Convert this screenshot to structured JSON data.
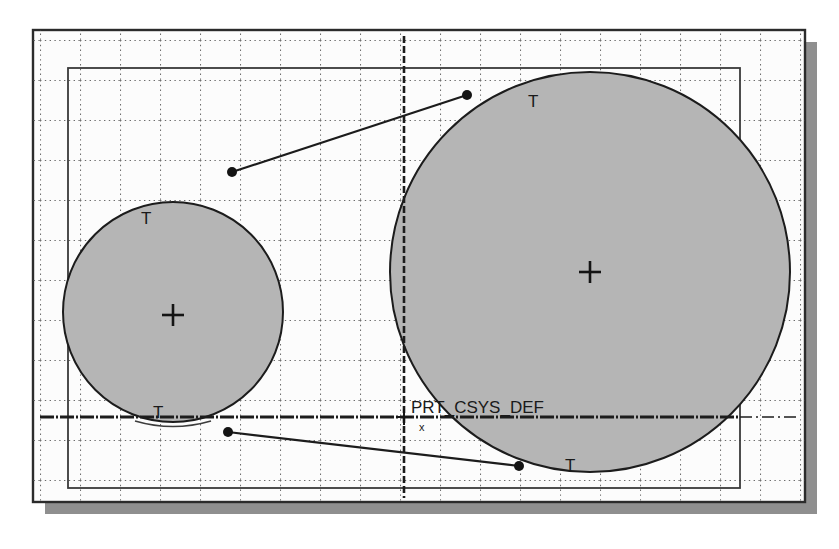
{
  "view": {
    "title": "CAD sketch view",
    "background_color": "#ffffff",
    "width": 839,
    "height": 549
  },
  "canvas": {
    "outer_frame": {
      "name": "graphics-window-frame",
      "x": 33,
      "y": 30,
      "width": 772,
      "height": 472,
      "stroke": "#2b2b2b",
      "fill": "#fcfcfc"
    },
    "shadow": {
      "color": "#8f8f8f",
      "offset_x": 12,
      "offset_y": 12
    },
    "inner_rect": {
      "name": "sketch-boundary-rect",
      "x": 68,
      "y": 68,
      "width": 672,
      "height": 420,
      "stroke": "#3a3a3a"
    },
    "grid": {
      "name": "reference-grid",
      "spacing": 40,
      "dot_color": "#6d6d6d",
      "visible": true
    }
  },
  "datums": {
    "horizontal": {
      "name": "datum-axis-horizontal",
      "y": 417,
      "x_start": 40,
      "x_end": 800,
      "style": "dash-dot",
      "color": "#1c1c1c"
    },
    "vertical": {
      "name": "datum-axis-vertical",
      "x": 404,
      "y_start": 36,
      "y_end": 498,
      "style": "dashed",
      "color": "#1c1c1c"
    }
  },
  "coordinate_system": {
    "name": "PRT_CSYS_DEF",
    "label": "PRT_CSYS_DEF",
    "axis_label": "x",
    "origin_x": 404,
    "origin_y": 417,
    "label_x": 411,
    "label_y": 411
  },
  "circles": [
    {
      "id": "small-circle",
      "name": "sketch-circle-small",
      "cx": 173,
      "cy": 312,
      "r": 110,
      "fill": "#b5b5b5",
      "stroke": "#1c1c1c",
      "center_marker": {
        "name": "center-cross-small",
        "cx": 173,
        "cy": 315,
        "size": 11
      }
    },
    {
      "id": "large-circle",
      "name": "sketch-circle-large",
      "cx": 590,
      "cy": 272,
      "r": 200,
      "fill": "#b5b5b5",
      "stroke": "#1c1c1c",
      "center_marker": {
        "name": "center-cross-large",
        "cx": 590,
        "cy": 272,
        "size": 11
      }
    }
  ],
  "constraint_markers": [
    {
      "id": "t1",
      "name": "tangent-constraint-marker",
      "label": "T",
      "x": 141,
      "y": 217
    },
    {
      "id": "t2",
      "name": "tangent-constraint-marker",
      "label": "T",
      "x": 528,
      "y": 100
    },
    {
      "id": "t3",
      "name": "tangent-constraint-marker",
      "label": "T",
      "x": 153,
      "y": 411
    },
    {
      "id": "t4",
      "name": "tangent-constraint-marker",
      "label": "T",
      "x": 565,
      "y": 464
    }
  ],
  "tangent_lines": [
    {
      "id": "upper-tangent",
      "name": "tangent-line-upper",
      "x1": 232,
      "y1": 172,
      "x2": 467,
      "y2": 95,
      "stroke": "#1c1c1c",
      "endpoint_radius": 5
    },
    {
      "id": "lower-tangent",
      "name": "tangent-line-lower",
      "x1": 228,
      "y1": 432,
      "x2": 519,
      "y2": 466,
      "stroke": "#1c1c1c",
      "endpoint_radius": 5
    }
  ],
  "colors": {
    "geometry_stroke": "#1c1c1c",
    "surface_fill": "#b5b5b5",
    "grid_dot": "#6d6d6d",
    "frame": "#2b2b2b",
    "shadow": "#8f8f8f"
  }
}
